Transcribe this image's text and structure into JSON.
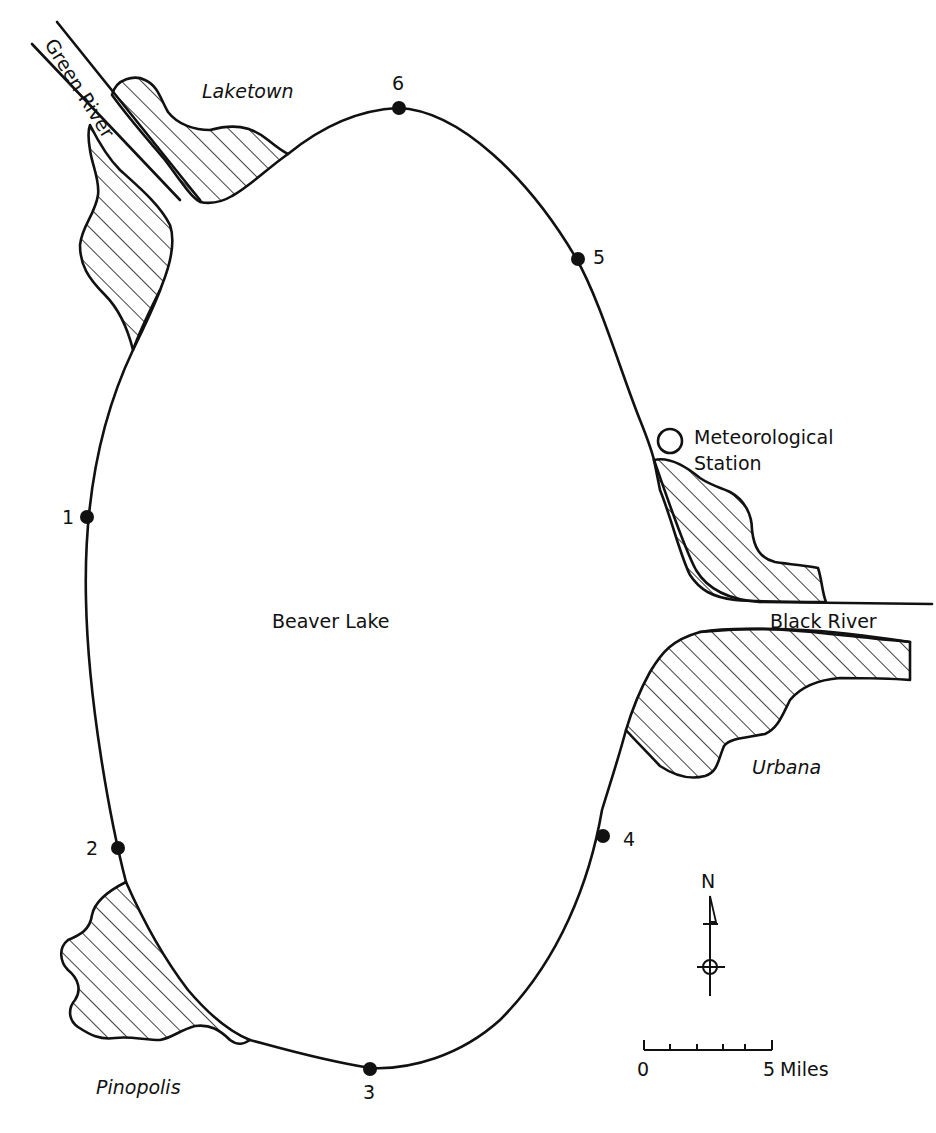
{
  "map": {
    "lake_label": "Beaver Lake",
    "rivers": [
      {
        "name": "Green River"
      },
      {
        "name": "Black River"
      }
    ],
    "towns": [
      {
        "name": "Laketown"
      },
      {
        "name": "Pinopolis"
      },
      {
        "name": "Urbana"
      }
    ],
    "meteorological_station": {
      "line1": "Meteorological",
      "line2": "Station"
    },
    "sampling_stations": [
      {
        "id": "1",
        "label": "1"
      },
      {
        "id": "2",
        "label": "2"
      },
      {
        "id": "3",
        "label": "3"
      },
      {
        "id": "4",
        "label": "4"
      },
      {
        "id": "5",
        "label": "5"
      },
      {
        "id": "6",
        "label": "6"
      }
    ],
    "north_arrow": {
      "label": "N"
    },
    "scale_bar": {
      "start": "0",
      "end": "5",
      "unit": "Miles",
      "divisions": 5
    },
    "colors": {
      "ink": "#111111",
      "background": "#ffffff"
    }
  }
}
